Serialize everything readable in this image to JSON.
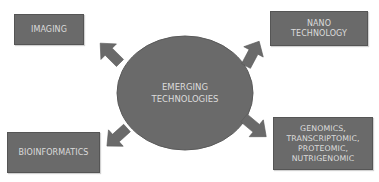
{
  "diagram": {
    "center": {
      "line1": "EMERGING",
      "line2": "TECHNOLOGIES"
    },
    "nodes": [
      {
        "id": "imaging",
        "lines": [
          "IMAGING"
        ]
      },
      {
        "id": "nano",
        "lines": [
          "NANO",
          "TECHNOLOGY"
        ]
      },
      {
        "id": "bioinformatics",
        "lines": [
          "BIOINFORMATICS"
        ]
      },
      {
        "id": "omics",
        "lines": [
          "GENOMICS,",
          "TRANSCRIPTOMIC,",
          "PROTEOMIC,",
          "NUTRIGENOMIC"
        ]
      }
    ],
    "colors": {
      "fill": "#6a6a6a",
      "border": "#555555",
      "text": "#dcdcdc",
      "background": "#ffffff"
    }
  }
}
